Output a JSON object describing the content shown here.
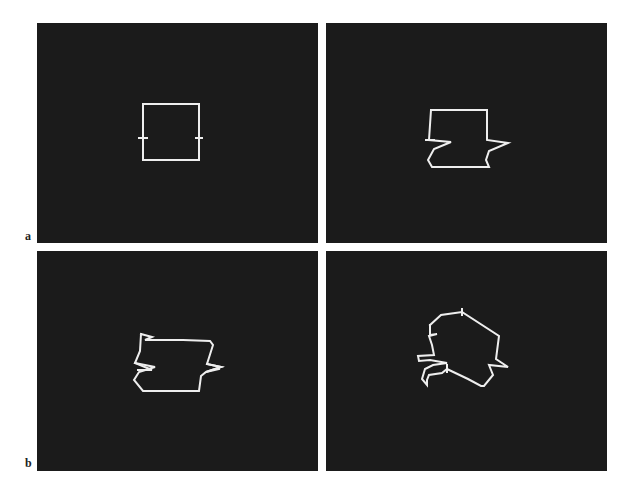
{
  "figure": {
    "labels": {
      "row_a": "a",
      "row_b": "b"
    },
    "panel_color": "#1b1b1b",
    "line_color": "#eeeeee",
    "panels": [
      {
        "id": "a-left",
        "description": "square outline with tick marks at mid-height on both sides"
      },
      {
        "id": "a-right",
        "description": "square outline with zigzag deformation on lower half"
      },
      {
        "id": "b-left",
        "description": "outline with zigzags on both sides, slightly skewed top"
      },
      {
        "id": "b-right",
        "description": "rotated distorted outline with zigzag notches"
      }
    ]
  }
}
